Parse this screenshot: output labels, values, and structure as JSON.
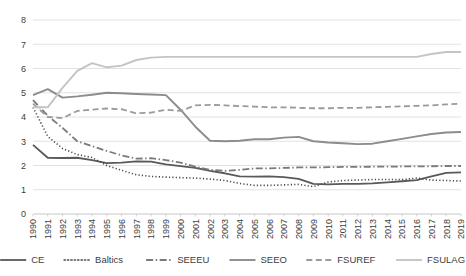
{
  "chart_data": {
    "type": "line",
    "title": "",
    "xlabel": "",
    "ylabel": "",
    "ylim": [
      0,
      8
    ],
    "yticks": [
      0,
      1,
      2,
      3,
      4,
      5,
      6,
      7,
      8
    ],
    "grid": true,
    "legend_position": "bottom",
    "x": [
      1990,
      1991,
      1992,
      1993,
      1994,
      1995,
      1996,
      1997,
      1998,
      1999,
      2000,
      2001,
      2002,
      2003,
      2004,
      2005,
      2006,
      2007,
      2008,
      2009,
      2010,
      2011,
      2012,
      2013,
      2014,
      2015,
      2016,
      2017,
      2018,
      2019
    ],
    "categories": [
      "1990",
      "1991",
      "1992",
      "1993",
      "1994",
      "1995",
      "1996",
      "1997",
      "1998",
      "1999",
      "2000",
      "2001",
      "2002",
      "2003",
      "2004",
      "2005",
      "2006",
      "2007",
      "2008",
      "2009",
      "2010",
      "2011",
      "2012",
      "2013",
      "2014",
      "2015",
      "2016",
      "2017",
      "2018",
      "2019"
    ],
    "series": [
      {
        "name": "CE",
        "style": "solid",
        "color": "#595959",
        "width": 1.8,
        "dash": "",
        "values": [
          2.85,
          2.32,
          2.31,
          2.32,
          2.22,
          2.1,
          2.12,
          2.17,
          2.16,
          2.05,
          1.97,
          1.9,
          1.78,
          1.68,
          1.55,
          1.54,
          1.55,
          1.52,
          1.45,
          1.24,
          1.22,
          1.24,
          1.24,
          1.26,
          1.3,
          1.35,
          1.4,
          1.55,
          1.7,
          1.72
        ]
      },
      {
        "name": "Baltics",
        "style": "dotted",
        "color": "#4a4a4a",
        "width": 1.6,
        "dash": "1.2,2.2",
        "values": [
          4.4,
          3.2,
          2.7,
          2.45,
          2.33,
          2.0,
          1.8,
          1.62,
          1.55,
          1.52,
          1.5,
          1.48,
          1.44,
          1.38,
          1.26,
          1.18,
          1.18,
          1.2,
          1.22,
          1.13,
          1.32,
          1.38,
          1.4,
          1.42,
          1.42,
          1.42,
          1.48,
          1.4,
          1.38,
          1.36
        ]
      },
      {
        "name": "SEEEU",
        "style": "dash-dot",
        "color": "#7a7a7a",
        "width": 1.8,
        "dash": "7,2.5,1.5,2.5",
        "values": [
          4.7,
          4.05,
          3.55,
          3.0,
          2.8,
          2.6,
          2.42,
          2.28,
          2.3,
          2.22,
          2.12,
          1.95,
          1.82,
          1.78,
          1.82,
          1.88,
          1.88,
          1.9,
          1.92,
          1.92,
          1.93,
          1.94,
          1.94,
          1.95,
          1.95,
          1.96,
          1.96,
          1.97,
          1.98,
          1.98
        ]
      },
      {
        "name": "SEEO",
        "style": "solid",
        "color": "#8c8c8c",
        "width": 1.9,
        "dash": "",
        "values": [
          4.9,
          5.15,
          4.8,
          4.85,
          4.92,
          5.0,
          4.98,
          4.95,
          4.93,
          4.9,
          4.3,
          3.6,
          3.02,
          3.0,
          3.02,
          3.08,
          3.08,
          3.15,
          3.18,
          3.0,
          2.95,
          2.92,
          2.88,
          2.9,
          3.0,
          3.1,
          3.2,
          3.3,
          3.36,
          3.38
        ]
      },
      {
        "name": "FSUREF",
        "style": "dashed",
        "color": "#9a9a9a",
        "width": 1.8,
        "dash": "6,3.5",
        "values": [
          4.55,
          4.0,
          3.95,
          4.25,
          4.3,
          4.35,
          4.32,
          4.15,
          4.18,
          4.3,
          4.25,
          4.48,
          4.5,
          4.48,
          4.45,
          4.43,
          4.4,
          4.4,
          4.38,
          4.36,
          4.36,
          4.38,
          4.38,
          4.4,
          4.42,
          4.44,
          4.46,
          4.48,
          4.52,
          4.55
        ]
      },
      {
        "name": "FSULAG",
        "style": "solid",
        "color": "#c4c4c4",
        "width": 1.9,
        "dash": "",
        "values": [
          4.4,
          4.4,
          5.2,
          5.9,
          6.22,
          6.05,
          6.12,
          6.35,
          6.45,
          6.48,
          6.48,
          6.48,
          6.48,
          6.48,
          6.48,
          6.48,
          6.48,
          6.48,
          6.48,
          6.48,
          6.48,
          6.48,
          6.48,
          6.48,
          6.48,
          6.48,
          6.48,
          6.6,
          6.68,
          6.68
        ]
      }
    ]
  },
  "legend": {
    "items": [
      {
        "label": "CE"
      },
      {
        "label": "Baltics"
      },
      {
        "label": "SEEEU"
      },
      {
        "label": "SEEO"
      },
      {
        "label": "FSUREF"
      },
      {
        "label": "FSULAG"
      }
    ]
  },
  "layout": {
    "plot": {
      "left": 33,
      "top": 20,
      "right": 461,
      "bottom": 214
    },
    "legend_y": 260,
    "legend_start_x": 37,
    "legend_line_len": 26,
    "legend_gap_after_line": 5,
    "legend_item_gap": 20
  }
}
